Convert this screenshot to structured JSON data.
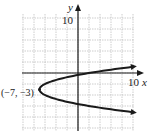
{
  "chart_data": {
    "type": "line",
    "title": "",
    "xlabel": "x",
    "ylabel": "y",
    "xlim": [
      -10,
      10
    ],
    "ylim": [
      -10.5,
      10.5
    ],
    "grid": true,
    "grid_step": 2,
    "tick_labels": {
      "x": [
        "10"
      ],
      "y": [
        "10"
      ]
    },
    "equation": "x = (y + 3)^2 - 7",
    "series": [
      {
        "name": "parabola",
        "x": [
          10,
          2,
          -3,
          -6,
          -7,
          -6,
          -3,
          2,
          10
        ],
        "y": [
          1.12,
          0,
          -1,
          -2,
          -3,
          -4,
          -5,
          -6,
          -7.12
        ]
      }
    ],
    "annotations": [
      {
        "text": "(-7, -3)",
        "x": -7,
        "y": -3,
        "position": "left of vertex"
      }
    ]
  },
  "labels": {
    "y_axis": "y",
    "x_axis": "x",
    "y_tick": "10",
    "x_tick": "10",
    "vertex": "(−7, −3)"
  },
  "colors": {
    "grid": "#b8b8b8",
    "axis": "#1a1a1a",
    "curve": "#1a1a1a"
  }
}
